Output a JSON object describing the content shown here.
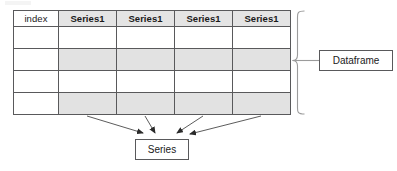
{
  "diagram": {
    "table": {
      "columns": [
        {
          "label": "index",
          "kind": "index",
          "bold": false
        },
        {
          "label": "Series1",
          "kind": "series",
          "bold": true
        },
        {
          "label": "Series1",
          "kind": "series",
          "bold": true
        },
        {
          "label": "Series1",
          "kind": "series",
          "bold": true
        },
        {
          "label": "Series1",
          "kind": "series",
          "bold": true
        }
      ],
      "body_rows": [
        {
          "index_cell": "",
          "shaded": false,
          "cells": [
            "",
            "",
            "",
            ""
          ]
        },
        {
          "index_cell": "",
          "shaded": true,
          "cells": [
            "",
            "",
            "",
            ""
          ]
        },
        {
          "index_cell": "",
          "shaded": false,
          "cells": [
            "",
            "",
            "",
            ""
          ]
        },
        {
          "index_cell": "",
          "shaded": true,
          "cells": [
            "",
            "",
            "",
            ""
          ]
        }
      ],
      "row_count": 4,
      "column_count": 5
    },
    "annotations": {
      "dataframe_label": "Dataframe",
      "series_label": "Series",
      "bracket_side": "right",
      "arrow_count": 4,
      "arrow_direction": "columns-to-series"
    },
    "colors": {
      "line": "#59595b",
      "header_fill": "#e4e4e4",
      "stripe_fill": "#e2e2e2",
      "cell_fill": "#ffffff",
      "page_background": "#ffffff",
      "text": "#1a1a1a"
    }
  }
}
